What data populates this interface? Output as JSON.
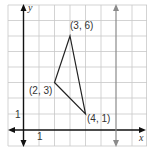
{
  "diagram": {
    "type": "coordinate-plane",
    "axes": {
      "x_label": "x",
      "y_label": "y"
    },
    "tick_labels": {
      "x_unit": "1",
      "y_unit": "1"
    },
    "triangle": {
      "vertices": [
        {
          "label": "(3, 6)",
          "x": 3,
          "y": 6
        },
        {
          "label": "(2, 3)",
          "x": 2,
          "y": 3
        },
        {
          "label": "(4, 1)",
          "x": 4,
          "y": 1
        }
      ]
    },
    "vertical_line": {
      "x": 6,
      "color": "#8a8a8a"
    },
    "colors": {
      "grid": "#c8c8c8",
      "axis": "#111111",
      "triangle": "#222222"
    }
  }
}
